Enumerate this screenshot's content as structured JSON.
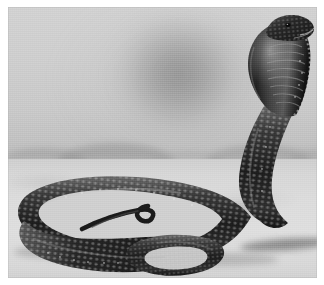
{
  "image": {
    "title": "Cobra",
    "subject": "cobra",
    "medium": "black-and-white photograph",
    "orientation": "landscape",
    "width_px": 324,
    "height_px": 285,
    "border": {
      "present": true,
      "color": "#ffffff",
      "top_px": 7,
      "left_px": 8,
      "right_px": 7,
      "bottom_px": 7
    },
    "plate": {
      "width_px": 309,
      "height_px": 271
    }
  },
  "scene": {
    "description": "A cobra rears up with its hood fully spread on open sandy ground; the rest of its long body lies coiled in loose loops across the foreground. The backdrop is a hazy pale studio-like sky with a faint dark blur behind the snake and low indistinct hills along the horizon.",
    "lighting": "diffuse frontal light from the upper left, casting soft shadows beneath the coils",
    "time_of_day": "indeterminate / overcast",
    "palette": {
      "sky_light": "#d2d2d2",
      "sky_blur": "#8e8e8e",
      "horizon_haze": "#c2c2c2",
      "hills": "#969696",
      "ground_sand": "#dcdcdc",
      "ground_shadow": "#9a9a9a",
      "snake_dark": "#1e1e1e",
      "snake_mid": "#4a4a4a",
      "snake_highlight": "#d8d8d8",
      "frame": "#ffffff"
    }
  },
  "elements": {
    "sky": {
      "label": "hazy pale backdrop",
      "blur_spot": "soft dark oval shadow in the upper-centre of the backdrop"
    },
    "horizon": {
      "label": "distant hazy horizon line",
      "y_fraction": 0.47,
      "hills": [
        {
          "name": "hill-left",
          "size": "small"
        },
        {
          "name": "hill-left-centre",
          "size": "medium"
        },
        {
          "name": "hill-centre",
          "size": "low"
        },
        {
          "name": "hill-right-centre",
          "size": "medium"
        },
        {
          "name": "hill-right",
          "size": "small"
        }
      ]
    },
    "ground": {
      "label": "flat sandy ground",
      "texture": "fine mottled sand"
    },
    "cobra": {
      "label": "cobra",
      "pose": "reared with hood spread",
      "parts": [
        {
          "name": "head",
          "detail": "triangular head tilted to the right, small dark eye and pale lip scales visible"
        },
        {
          "name": "hood",
          "detail": "broad spread hood with banded ventral scale rows and pale speckled edges"
        },
        {
          "name": "neck",
          "detail": "upright S-curved neck descending to the ground on the right"
        },
        {
          "name": "body-coil-outer",
          "detail": "long outer loop sweeping left across the foreground"
        },
        {
          "name": "body-coil-inner",
          "detail": "inner loop crossing over itself near the centre"
        },
        {
          "name": "tail",
          "detail": "slender tail tip curling upward in the middle of the frame"
        }
      ],
      "scale_pattern": "overlapping keeled scales with bright specular highlights along the dorsal ridge"
    },
    "shadows": [
      {
        "name": "shadow-under-body-left",
        "label": "soft shadow beneath the left coil"
      },
      {
        "name": "shadow-under-body-right",
        "label": "soft shadow beneath the right coil"
      },
      {
        "name": "shadow-cast-right",
        "label": "dark cast shadow stretching right from the snake's base"
      }
    ]
  }
}
